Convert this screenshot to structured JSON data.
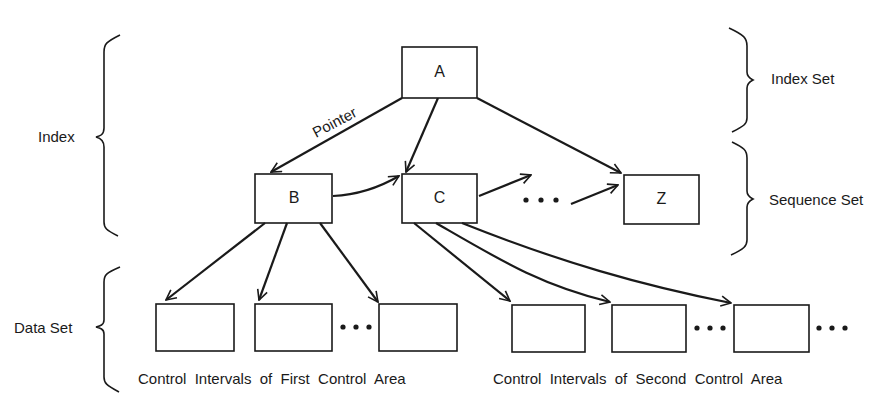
{
  "diagram": {
    "nodes": {
      "A": {
        "label": "A",
        "level": "index-set"
      },
      "B": {
        "label": "B",
        "level": "sequence-set"
      },
      "C": {
        "label": "C",
        "level": "sequence-set"
      },
      "Z": {
        "label": "Z",
        "level": "sequence-set"
      }
    },
    "edge_label": "Pointer",
    "ellipsis": "• • •",
    "braces": {
      "index": "Index",
      "index_set": "Index Set",
      "sequence_set": "Sequence Set",
      "data_set": "Data Set"
    },
    "captions": {
      "first": "Control  Intervals  of  First  Control  Area",
      "second": "Control  Intervals  of  Second  Control  Area"
    },
    "edges": [
      {
        "from": "A",
        "to": "B",
        "label": "Pointer"
      },
      {
        "from": "A",
        "to": "C"
      },
      {
        "from": "A",
        "to": "Z"
      },
      {
        "from": "B",
        "to": "C"
      },
      {
        "from": "C",
        "to": "..."
      },
      {
        "from": "...",
        "to": "Z"
      },
      {
        "from": "B",
        "to": "CI-1-1"
      },
      {
        "from": "B",
        "to": "CI-1-2"
      },
      {
        "from": "B",
        "to": "CI-1-n"
      },
      {
        "from": "C",
        "to": "CI-2-1"
      },
      {
        "from": "C",
        "to": "CI-2-2"
      },
      {
        "from": "C",
        "to": "CI-2-n"
      }
    ]
  }
}
